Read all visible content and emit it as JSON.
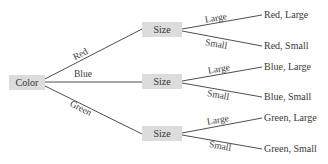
{
  "root": {
    "label": "Color"
  },
  "branches": [
    {
      "edge_label": "Red",
      "node_label": "Size",
      "children": [
        {
          "edge_label": "Large",
          "outcome": "Red, Large"
        },
        {
          "edge_label": "Small",
          "outcome": "Red, Small"
        }
      ]
    },
    {
      "edge_label": "Blue",
      "node_label": "Size",
      "children": [
        {
          "edge_label": "Large",
          "outcome": "Blue, Large"
        },
        {
          "edge_label": "Small",
          "outcome": "Blue, Small"
        }
      ]
    },
    {
      "edge_label": "Green",
      "node_label": "Size",
      "children": [
        {
          "edge_label": "Large",
          "outcome": "Green, Large"
        },
        {
          "edge_label": "Small",
          "outcome": "Green, Small"
        }
      ]
    }
  ],
  "colors": {
    "node_fill": "#dcdcdc",
    "line": "#3a3a3a",
    "text": "#3a3a3a"
  }
}
